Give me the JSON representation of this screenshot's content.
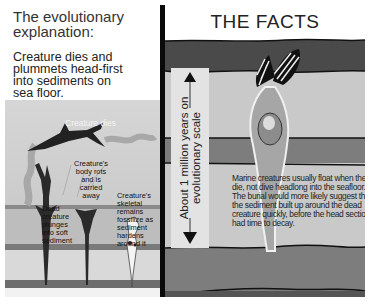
{
  "left_panel": {
    "title_line1": "The evolutionary",
    "title_line2": "explanation:",
    "subtitle_line1": "Creature dies and",
    "subtitle_line2": "plummets head-first",
    "subtitle_line3": "into sediments on",
    "subtitle_line4": "sea floor.",
    "labels": {
      "creature_dies": "Creature dies",
      "body_rots": [
        "Creature's",
        "body rots",
        "and is",
        "carried",
        "away"
      ],
      "dead_plunges": [
        "Dead",
        "creature",
        "plunges",
        "into soft",
        "sediment"
      ],
      "skeletal": [
        "Creature's",
        "skeletal",
        "remains",
        "fossilize as",
        "sediment",
        "hardens",
        "around it"
      ]
    }
  },
  "right_panel": {
    "title": "THE FACTS",
    "scale_line1": "About 1 million years on",
    "scale_line2": "evolutionary scale",
    "facts_text": "Marine creatures usually float when they die, not dive headlong into the seafloor. The burial would more likely suggest that the sediment built up around the dead creature quickly, before the head section had time to decay."
  },
  "colors": {
    "dark_sediment": "#4a4a4a",
    "mid_sediment": "#7d7d7d",
    "light_sediment": "#c9c9c9",
    "divider": "#0a0a0a"
  }
}
